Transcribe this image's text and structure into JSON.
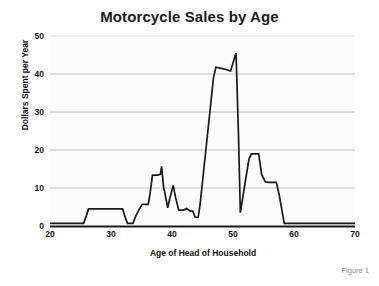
{
  "figure": {
    "caption": "Figure 1",
    "background_color": "#ffffff",
    "line_color": "#1a1a1a",
    "grid_color": "#b9b9b9",
    "plot_fill": "#fbfbfb"
  },
  "chart_data": {
    "type": "line",
    "title": "Motorcycle Sales by Age",
    "xlabel": "Age of Head of Household",
    "ylabel": "Dollars Spent per Year",
    "xlim": [
      20,
      70
    ],
    "ylim": [
      0,
      50
    ],
    "xticks": [
      20,
      30,
      40,
      50,
      60,
      70
    ],
    "yticks": [
      0,
      10,
      20,
      30,
      40,
      50
    ],
    "xtick_labels": [
      "20",
      "30",
      "40",
      "50",
      "60",
      "70"
    ],
    "ytick_labels": [
      "0",
      "10",
      "20",
      "30",
      "40",
      "50"
    ],
    "grid": "horizontal",
    "legend": null,
    "series": [
      {
        "name": "Dollars Spent per Year",
        "x": [
          20.0,
          25.5,
          25.9,
          26.3,
          31.9,
          32.3,
          32.7,
          33.6,
          34.0,
          34.6,
          35.1,
          36.1,
          36.4,
          36.8,
          37.6,
          38.1,
          38.3,
          38.6,
          39.3,
          39.6,
          40.2,
          40.6,
          41.1,
          41.9,
          42.4,
          43.0,
          43.4,
          43.8,
          44.3,
          44.6,
          46.8,
          47.2,
          48.6,
          49.6,
          50.5,
          50.9,
          51.2,
          51.6,
          52.6,
          53.0,
          54.2,
          54.7,
          55.3,
          55.9,
          57.1,
          57.6,
          58.4,
          58.8,
          70.0
        ],
        "y": [
          0.7,
          0.7,
          2.4,
          4.5,
          4.5,
          2.4,
          0.7,
          0.7,
          2.4,
          4.3,
          5.7,
          5.7,
          8.5,
          13.4,
          13.4,
          13.6,
          15.7,
          10.5,
          4.8,
          7.0,
          10.7,
          7.4,
          4.2,
          4.2,
          4.6,
          3.9,
          3.9,
          2.3,
          2.3,
          5.6,
          39.0,
          41.8,
          41.3,
          40.8,
          45.5,
          24.0,
          3.5,
          7.5,
          17.5,
          19.0,
          19.0,
          13.5,
          11.6,
          11.5,
          11.5,
          8.0,
          0.7,
          0.7,
          0.7
        ]
      }
    ]
  },
  "axes": {
    "y_tick_positions_px": [
      226,
      188,
      150,
      112,
      74,
      36
    ],
    "x_tick_positions_px": [
      50,
      111,
      172,
      233,
      294,
      355
    ]
  }
}
